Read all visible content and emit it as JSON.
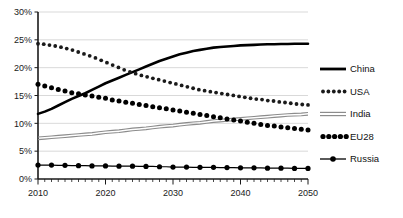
{
  "chart_data": {
    "type": "line",
    "title": "",
    "subtitle": "",
    "xlabel": "",
    "ylabel": "",
    "xlim": [
      2010,
      2050
    ],
    "ylim": [
      0,
      30
    ],
    "yticks": [
      0,
      5,
      10,
      15,
      20,
      25,
      30
    ],
    "ytick_labels": [
      "0%",
      "5%",
      "10%",
      "15%",
      "20%",
      "25%",
      "30%"
    ],
    "xticks": [
      2010,
      2020,
      2030,
      2040,
      2050
    ],
    "xtick_labels": [
      "2010",
      "2020",
      "2030",
      "2040",
      "2050"
    ],
    "minor_xtick_interval": 1,
    "grid": "horizontal",
    "legend_position": "right",
    "value_unit": "percent",
    "x": [
      2010,
      2011,
      2012,
      2013,
      2014,
      2015,
      2016,
      2017,
      2018,
      2019,
      2020,
      2021,
      2022,
      2023,
      2024,
      2025,
      2026,
      2027,
      2028,
      2029,
      2030,
      2031,
      2032,
      2033,
      2034,
      2035,
      2036,
      2037,
      2038,
      2039,
      2040,
      2041,
      2042,
      2043,
      2044,
      2045,
      2046,
      2047,
      2048,
      2049,
      2050
    ],
    "series": [
      {
        "name": "China",
        "color": "#000000",
        "style": "solid-thick",
        "values": [
          11.7,
          12.1,
          12.6,
          13.2,
          13.8,
          14.4,
          14.9,
          15.4,
          16.0,
          16.6,
          17.2,
          17.7,
          18.2,
          18.7,
          19.2,
          19.7,
          20.2,
          20.7,
          21.2,
          21.6,
          22.0,
          22.4,
          22.7,
          23.0,
          23.2,
          23.4,
          23.6,
          23.7,
          23.8,
          23.9,
          24.0,
          24.05,
          24.1,
          24.15,
          24.2,
          24.2,
          24.25,
          24.25,
          24.3,
          24.3,
          24.3
        ]
      },
      {
        "name": "USA",
        "color": "#1a1a1a",
        "style": "dotted-medium",
        "values": [
          24.3,
          24.2,
          24.0,
          23.8,
          23.5,
          23.2,
          22.8,
          22.4,
          22.0,
          21.5,
          21.0,
          20.5,
          20.0,
          19.5,
          19.1,
          18.7,
          18.4,
          18.1,
          17.8,
          17.5,
          17.2,
          16.9,
          16.6,
          16.3,
          16.0,
          15.8,
          15.6,
          15.4,
          15.2,
          15.0,
          14.8,
          14.6,
          14.4,
          14.3,
          14.1,
          14.0,
          13.8,
          13.7,
          13.5,
          13.4,
          13.3
        ]
      },
      {
        "name": "India",
        "color": "#8c8c8c",
        "style": "double-thin",
        "values": [
          7.3,
          7.4,
          7.5,
          7.6,
          7.7,
          7.8,
          7.9,
          8.0,
          8.1,
          8.25,
          8.4,
          8.5,
          8.6,
          8.75,
          8.9,
          9.0,
          9.1,
          9.25,
          9.4,
          9.5,
          9.6,
          9.75,
          9.9,
          10.0,
          10.1,
          10.25,
          10.4,
          10.5,
          10.6,
          10.7,
          10.8,
          10.9,
          11.0,
          11.1,
          11.2,
          11.3,
          11.4,
          11.5,
          11.55,
          11.6,
          11.7
        ]
      },
      {
        "name": "EU28",
        "color": "#000000",
        "style": "dotted-large",
        "values": [
          17.0,
          16.7,
          16.4,
          16.1,
          15.8,
          15.5,
          15.3,
          15.1,
          14.9,
          14.7,
          14.5,
          14.2,
          14.0,
          13.8,
          13.6,
          13.4,
          13.2,
          13.0,
          12.8,
          12.6,
          12.4,
          12.2,
          12.0,
          11.8,
          11.6,
          11.4,
          11.2,
          11.0,
          10.8,
          10.6,
          10.4,
          10.2,
          10.0,
          9.8,
          9.6,
          9.5,
          9.35,
          9.2,
          9.05,
          8.95,
          8.8
        ]
      },
      {
        "name": "Russia",
        "color": "#000000",
        "style": "line-with-markers",
        "values": [
          2.5,
          2.5,
          2.5,
          2.45,
          2.45,
          2.4,
          2.4,
          2.4,
          2.35,
          2.35,
          2.35,
          2.3,
          2.3,
          2.3,
          2.3,
          2.25,
          2.25,
          2.25,
          2.2,
          2.2,
          2.15,
          2.15,
          2.15,
          2.1,
          2.1,
          2.1,
          2.1,
          2.05,
          2.05,
          2.05,
          2.0,
          2.0,
          2.0,
          2.0,
          1.95,
          1.95,
          1.95,
          1.95,
          1.9,
          1.9,
          1.9
        ]
      }
    ]
  },
  "legend": {
    "items": [
      {
        "label": "China"
      },
      {
        "label": "USA"
      },
      {
        "label": "India"
      },
      {
        "label": "EU28"
      },
      {
        "label": "Russia"
      }
    ]
  }
}
